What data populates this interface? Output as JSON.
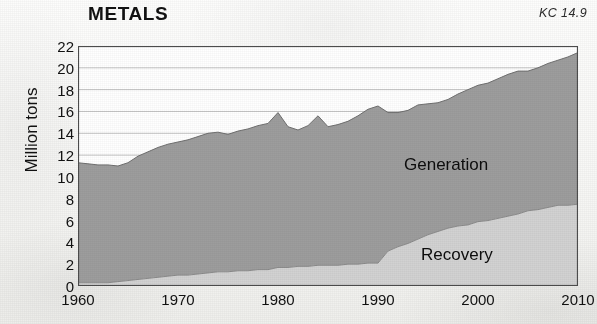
{
  "figure": {
    "title": "METALS",
    "code": "KC 14.9"
  },
  "labels": {
    "generation": "Generation",
    "recovery": "Recovery"
  },
  "chart_data": {
    "type": "area",
    "title": "METALS",
    "annotation": "KC 14.9",
    "xlabel": "",
    "ylabel": "Million tons",
    "stacked": true,
    "grid": true,
    "grid_axis": "y",
    "legend": "inline-labels",
    "legend_position": "inside-plot",
    "xlim": [
      1960,
      2010
    ],
    "ylim": [
      0,
      22
    ],
    "yticks": [
      0,
      2,
      4,
      6,
      8,
      10,
      12,
      14,
      16,
      18,
      20,
      22
    ],
    "ytick_labels": [
      "0",
      "2",
      "4",
      "6",
      "8",
      "10",
      "12",
      "14",
      "16",
      "18",
      "20",
      "22"
    ],
    "xticks": [
      1960,
      1970,
      1980,
      1990,
      2000,
      2010
    ],
    "xtick_labels": [
      "1960",
      "1970",
      "1980",
      "1990",
      "2000",
      "2010"
    ],
    "colors": {
      "generation_fill": "#9d9d9d",
      "recovery_fill": "#d2d2d2",
      "axis": "#555555",
      "grid": "#bcbcbc",
      "text": "#111111"
    },
    "x": [
      1960,
      1961,
      1962,
      1963,
      1964,
      1965,
      1966,
      1967,
      1968,
      1969,
      1970,
      1971,
      1972,
      1973,
      1974,
      1975,
      1976,
      1977,
      1978,
      1979,
      1980,
      1981,
      1982,
      1983,
      1984,
      1985,
      1986,
      1987,
      1988,
      1989,
      1990,
      1991,
      1992,
      1993,
      1994,
      1995,
      1996,
      1997,
      1998,
      1999,
      2000,
      2001,
      2002,
      2003,
      2004,
      2005,
      2006,
      2007,
      2008,
      2009,
      2010
    ],
    "series": [
      {
        "name": "Generation",
        "note": "Total generation = top of stacked area (Recovery + Generation band)",
        "values": [
          11.3,
          11.2,
          11.1,
          11.1,
          11.0,
          11.3,
          11.9,
          12.3,
          12.7,
          13.0,
          13.2,
          13.4,
          13.7,
          14.0,
          14.1,
          13.9,
          14.2,
          14.4,
          14.7,
          14.9,
          15.9,
          14.6,
          14.3,
          14.7,
          15.6,
          14.6,
          14.8,
          15.1,
          15.6,
          16.2,
          16.5,
          15.9,
          15.9,
          16.1,
          16.6,
          16.7,
          16.8,
          17.1,
          17.6,
          18.0,
          18.4,
          18.6,
          19.0,
          19.4,
          19.7,
          19.7,
          20.0,
          20.4,
          20.7,
          21.0,
          21.4
        ]
      },
      {
        "name": "Recovery",
        "note": "Lower band of the stacked area (materials recovered for recycling)",
        "values": [
          0.3,
          0.3,
          0.3,
          0.3,
          0.4,
          0.5,
          0.6,
          0.7,
          0.8,
          0.9,
          1.0,
          1.0,
          1.1,
          1.2,
          1.3,
          1.3,
          1.4,
          1.4,
          1.5,
          1.5,
          1.7,
          1.7,
          1.8,
          1.8,
          1.9,
          1.9,
          1.9,
          2.0,
          2.0,
          2.1,
          2.1,
          3.2,
          3.6,
          3.9,
          4.3,
          4.7,
          5.0,
          5.3,
          5.5,
          5.6,
          5.9,
          6.0,
          6.2,
          6.4,
          6.6,
          6.9,
          7.0,
          7.2,
          7.4,
          7.4,
          7.5
        ]
      }
    ]
  }
}
